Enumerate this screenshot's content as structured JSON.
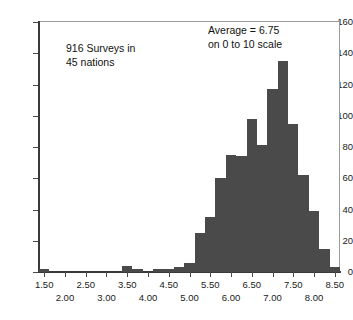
{
  "figure": {
    "name": "life-satisfaction-histogram",
    "bar_color": "#4a4a4a",
    "frame_color": "#9a9a9a",
    "axis_color": "#3a3a3a"
  },
  "annotations": {
    "count_note": "916 Surveys in\n45 nations",
    "average_note": "Average = 6.75\non 0 to 10 scale"
  },
  "axes": {
    "y_ticks": [
      0,
      20,
      40,
      60,
      80,
      100,
      120,
      140,
      160
    ],
    "y_tick_labels": [
      "0",
      "20",
      "40",
      "60",
      "80",
      "100",
      "120",
      "140",
      "160"
    ],
    "x_ticks_upper": [
      "1.50",
      "2.50",
      "3.50",
      "4.50",
      "5.50",
      "6.50",
      "7.50",
      "8.50"
    ],
    "x_ticks_upper_values": [
      1.5,
      2.5,
      3.5,
      4.5,
      5.5,
      6.5,
      7.5,
      8.5
    ],
    "x_ticks_lower": [
      "2.00",
      "3.00",
      "4.00",
      "5.00",
      "6.00",
      "7.00",
      "8.00"
    ],
    "x_ticks_lower_values": [
      2.0,
      3.0,
      4.0,
      5.0,
      6.0,
      7.0,
      8.0
    ]
  },
  "chart_data": {
    "type": "bar",
    "title": "",
    "subtitle": "",
    "xlabel": "",
    "ylabel": "",
    "xlim": [
      1.375,
      8.625
    ],
    "ylim": [
      0,
      160
    ],
    "grid": false,
    "legend": null,
    "bin_width": 0.25,
    "orientation": "vertical",
    "annotations": [
      "916 Surveys in 45 nations",
      "Average = 6.75 on 0 to 10 scale"
    ],
    "categories": [
      "1.50",
      "1.75",
      "2.00",
      "2.25",
      "2.50",
      "2.75",
      "3.00",
      "3.25",
      "3.50",
      "3.75",
      "4.00",
      "4.25",
      "4.50",
      "4.75",
      "5.00",
      "5.25",
      "5.50",
      "5.75",
      "6.00",
      "6.25",
      "6.50",
      "6.75",
      "7.00",
      "7.25",
      "7.50",
      "7.75",
      "8.00",
      "8.25",
      "8.50"
    ],
    "x": [
      1.5,
      1.75,
      2.0,
      2.25,
      2.5,
      2.75,
      3.0,
      3.25,
      3.5,
      3.75,
      4.0,
      4.25,
      4.5,
      4.75,
      5.0,
      5.25,
      5.5,
      5.75,
      6.0,
      6.25,
      6.5,
      6.75,
      7.0,
      7.25,
      7.5,
      7.75,
      8.0,
      8.25,
      8.5
    ],
    "values": [
      2,
      0,
      0,
      0,
      0,
      0,
      0,
      0,
      4,
      2,
      0,
      2,
      2,
      3,
      6,
      25,
      35,
      60,
      75,
      74,
      98,
      81,
      117,
      135,
      95,
      62,
      39,
      15,
      3
    ]
  }
}
